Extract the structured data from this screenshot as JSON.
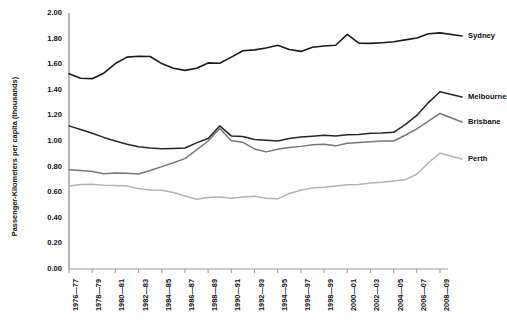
{
  "chart_data": {
    "type": "line",
    "title": "",
    "subtitle": "",
    "xlabel": "",
    "ylabel": "Passenger-Kilometers per capita (thousands)",
    "ylim": [
      0.0,
      2.0
    ],
    "ytick_labels": [
      "0.00",
      "0.20",
      "0.40",
      "0.60",
      "0.80",
      "1.00",
      "1.20",
      "1.40",
      "1.60",
      "1.80",
      "2.00"
    ],
    "ytick_values": [
      0.0,
      0.2,
      0.4,
      0.6,
      0.8,
      1.0,
      1.2,
      1.4,
      1.6,
      1.8,
      2.0
    ],
    "grid": false,
    "legend_position": "right-inline",
    "x": [
      "1976-77",
      "1977-78",
      "1978-79",
      "1979-80",
      "1980-81",
      "1981-82",
      "1982-83",
      "1983-84",
      "1984-85",
      "1985-86",
      "1986-87",
      "1987-88",
      "1988-89",
      "1989-90",
      "1990-91",
      "1991-92",
      "1992-93",
      "1993-94",
      "1994-95",
      "1995-96",
      "1996-97",
      "1997-98",
      "1998-99",
      "1999-00",
      "2000-01",
      "2001-02",
      "2002-03",
      "2003-04",
      "2004-05",
      "2005-06",
      "2006-07",
      "2007-08",
      "2008-09"
    ],
    "xtick_labels": [
      "1976—77",
      "1978—79",
      "1980—81",
      "1982—83",
      "1984—85",
      "1986—87",
      "1988—89",
      "1990—91",
      "1992—93",
      "1994—95",
      "1996—97",
      "1998—99",
      "2000—01",
      "2002—03",
      "2004—05",
      "2006—07",
      "2008—09"
    ],
    "series": [
      {
        "name": "Sydney",
        "color": "#1a1a1a",
        "width": 1.6,
        "values": [
          1.525,
          1.49,
          1.487,
          1.53,
          1.605,
          1.655,
          1.662,
          1.66,
          1.605,
          1.568,
          1.552,
          1.568,
          1.61,
          1.608,
          1.655,
          1.705,
          1.712,
          1.727,
          1.748,
          1.715,
          1.7,
          1.732,
          1.742,
          1.748,
          1.833,
          1.765,
          1.763,
          1.768,
          1.775,
          1.79,
          1.805,
          1.838,
          1.845
        ]
      },
      {
        "name": "Melbourne",
        "color": "#262626",
        "width": 1.5,
        "values": [
          1.118,
          1.09,
          1.06,
          1.028,
          1.0,
          0.975,
          0.955,
          0.945,
          0.94,
          0.942,
          0.945,
          0.985,
          1.02,
          1.118,
          1.04,
          1.035,
          1.012,
          1.005,
          1.0,
          1.02,
          1.032,
          1.038,
          1.045,
          1.04,
          1.048,
          1.05,
          1.06,
          1.062,
          1.068,
          1.128,
          1.2,
          1.3,
          1.385
        ]
      },
      {
        "name": "Brisbane",
        "color": "#777777",
        "width": 1.5,
        "values": [
          0.775,
          0.77,
          0.762,
          0.745,
          0.75,
          0.748,
          0.742,
          0.77,
          0.8,
          0.83,
          0.862,
          0.93,
          1.0,
          1.098,
          1.002,
          0.99,
          0.938,
          0.915,
          0.935,
          0.95,
          0.958,
          0.97,
          0.975,
          0.962,
          0.982,
          0.988,
          0.995,
          1.0,
          1.0,
          1.045,
          1.095,
          1.155,
          1.215
        ]
      },
      {
        "name": "Perth",
        "color": "#b3b3b3",
        "width": 1.5,
        "values": [
          0.648,
          0.66,
          0.663,
          0.655,
          0.652,
          0.648,
          0.628,
          0.618,
          0.615,
          0.598,
          0.57,
          0.545,
          0.558,
          0.563,
          0.553,
          0.562,
          0.568,
          0.552,
          0.548,
          0.59,
          0.615,
          0.632,
          0.638,
          0.648,
          0.658,
          0.66,
          0.672,
          0.678,
          0.688,
          0.698,
          0.74,
          0.83,
          0.905
        ]
      }
    ],
    "series_labels": [
      {
        "name": "Sydney",
        "x": 468,
        "y": 32
      },
      {
        "name": "Melbourne",
        "x": 468,
        "y": 93
      },
      {
        "name": "Brisbane",
        "x": 468,
        "y": 118
      },
      {
        "name": "Perth",
        "x": 468,
        "y": 155
      }
    ]
  },
  "axes": {
    "plot_left": 69,
    "plot_right": 440,
    "plot_top": 13,
    "plot_bottom": 269,
    "axis_color": "#999999",
    "tick_color": "#999999"
  }
}
